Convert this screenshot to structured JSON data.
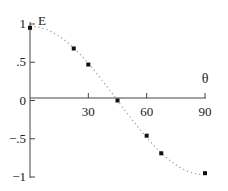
{
  "chart_data": {
    "type": "scatter",
    "title": "",
    "xlabel": "θ",
    "ylabel": "E",
    "xlim": [
      0,
      90
    ],
    "ylim": [
      -1,
      1
    ],
    "x_ticks": [
      30,
      60,
      90
    ],
    "x_tick_labels": [
      "30",
      "60",
      "90"
    ],
    "y_ticks": [
      1,
      0.5,
      0,
      -0.5,
      -1
    ],
    "y_tick_labels": [
      "1",
      ".5",
      "0",
      "−.5",
      "−1"
    ],
    "grid": false,
    "legend": null,
    "series": [
      {
        "name": "measured",
        "marker": "square",
        "x": [
          0,
          22.5,
          30,
          45,
          60,
          67.5,
          90
        ],
        "y": [
          0.95,
          0.68,
          0.47,
          0.0,
          -0.46,
          -0.69,
          -0.95
        ]
      },
      {
        "name": "fit",
        "style": "dotted",
        "function": "cos(2θ)"
      }
    ]
  }
}
